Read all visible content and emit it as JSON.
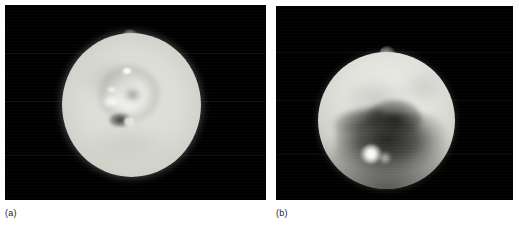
{
  "figure": {
    "width": 519,
    "height": 227,
    "background_color": "#ffffff",
    "panel_background_color": "#000000",
    "panel_count": 2
  },
  "panels": [
    {
      "id": "a",
      "caption": "(a)",
      "description": "bright washed-out disk of a moon with faint ring-shaped feature, bright spots and a dark spot near center, plus a small plume at the top limb",
      "disk": {
        "center_x_pct": 50,
        "center_y_pct": 51,
        "diameter_px": 139,
        "base_color": "#dcdcd6",
        "limb_color": "#6d6d67"
      },
      "features": [
        {
          "name": "top-limb-plume",
          "type": "plume",
          "brightness": "bright"
        },
        {
          "name": "central-bright-patch",
          "type": "bright-spot",
          "brightness": "very-bright"
        },
        {
          "name": "upper-bright-point",
          "type": "bright-spot",
          "brightness": "very-bright"
        },
        {
          "name": "dark-spot",
          "type": "dark-patch",
          "brightness": "dark"
        },
        {
          "name": "annular-ring-feature",
          "type": "ring",
          "brightness": "mid-gray"
        }
      ]
    },
    {
      "id": "b",
      "caption": "(b)",
      "description": "disk of a moon with bright northern hemisphere, dark mottled southern terrain, a prominent bright spot in the lower-left quadrant and a plume at the upper limb",
      "disk": {
        "center_x_pct": 46,
        "center_y_pct": 59,
        "diameter_px": 137,
        "base_color": "#e2e2dd",
        "limb_color": "#8a8a84"
      },
      "features": [
        {
          "name": "upper-limb-plume",
          "type": "plume",
          "brightness": "bright"
        },
        {
          "name": "southern-dark-terrain",
          "type": "dark-patch",
          "brightness": "very-dark"
        },
        {
          "name": "bright-volcanic-spot",
          "type": "bright-spot",
          "brightness": "very-bright"
        },
        {
          "name": "dark-streak",
          "type": "streak",
          "brightness": "dark"
        }
      ]
    }
  ],
  "colors": {
    "page_background": "#ffffff",
    "panel_background": "#000000",
    "caption_text": "#1a1a1a"
  }
}
